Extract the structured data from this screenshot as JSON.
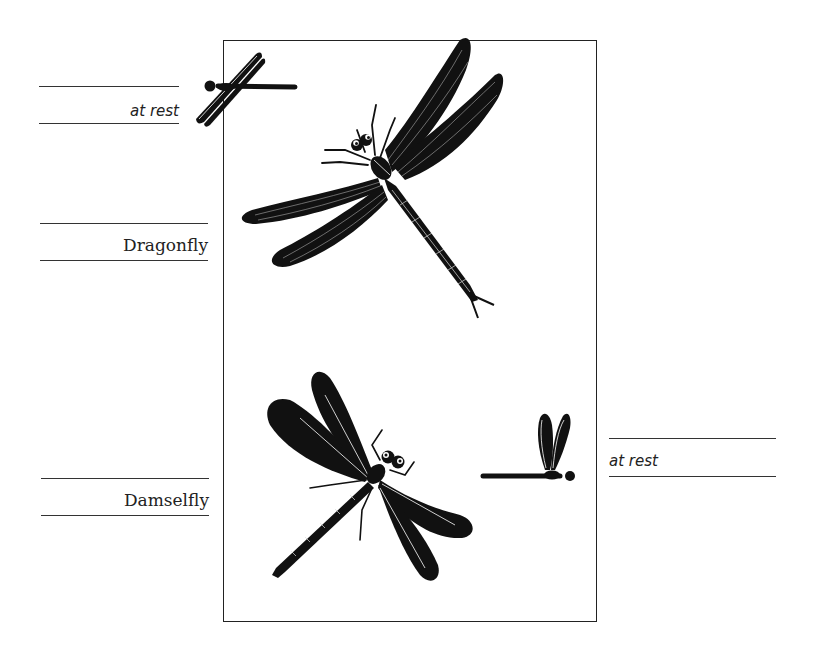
{
  "figure": {
    "labels": {
      "dragonfly_at_rest": "at rest",
      "dragonfly": "Dragonfly",
      "damselfly": "Damselfly",
      "damselfly_at_rest": "at rest"
    },
    "illustrations": [
      {
        "name": "dragonfly-at-rest-icon",
        "description": "Small dragonfly silhouette with wings held open flat at rest"
      },
      {
        "name": "dragonfly-illustration",
        "description": "Large dragonfly with veined wings spread, viewed from above"
      },
      {
        "name": "damselfly-illustration",
        "description": "Large damselfly with dark solid wings spread, viewed from above"
      },
      {
        "name": "damselfly-at-rest-icon",
        "description": "Small damselfly silhouette with wings folded upward together at rest"
      }
    ],
    "colors": {
      "ink": "#111111",
      "background": "#ffffff",
      "rule": "#333333"
    }
  }
}
